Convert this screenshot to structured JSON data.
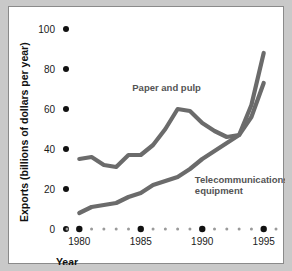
{
  "chart_data": {
    "type": "line",
    "title": "",
    "xlabel": "Year",
    "ylabel": "Exports (billions of dollars per year)",
    "xlim": [
      1979,
      1996
    ],
    "ylim": [
      0,
      100
    ],
    "yticks": [
      0,
      20,
      40,
      60,
      80,
      100
    ],
    "ytick_labels": [
      "0",
      "20",
      "40",
      "60",
      "80",
      "100"
    ],
    "xticks": [
      1980,
      1985,
      1990,
      1995
    ],
    "xtick_labels": [
      "1980",
      "1985",
      "1990",
      "1995"
    ],
    "xminor": [
      1979,
      1981,
      1982,
      1983,
      1984,
      1986,
      1987,
      1988,
      1989,
      1991,
      1992,
      1993,
      1994,
      1996
    ],
    "grid": false,
    "legend_position": "inline-annotations",
    "tick_style": "dots",
    "x": [
      1980,
      1981,
      1982,
      1983,
      1984,
      1985,
      1986,
      1987,
      1988,
      1989,
      1990,
      1991,
      1992,
      1993,
      1994,
      1995
    ],
    "series": [
      {
        "name": "Paper and pulp",
        "color": "#6b6b6b",
        "values": [
          35,
          36,
          32,
          31,
          37,
          37,
          42,
          50,
          60,
          59,
          53,
          49,
          46,
          47,
          56,
          73
        ],
        "label_x": 1987.1,
        "label_y": 69
      },
      {
        "name": "Telecommunications equipment",
        "color": "#6b6b6b",
        "values": [
          8,
          11,
          12,
          13,
          16,
          18,
          22,
          24,
          26,
          30,
          35,
          39,
          43,
          47,
          62,
          88
        ],
        "label_x": 1989.4,
        "label_y": 23,
        "label_line1": "Telecommunications",
        "label_line2": "equipment"
      }
    ]
  },
  "axis": {
    "y_title": "Exports (billions of dollars per year)",
    "x_title": "Year"
  }
}
